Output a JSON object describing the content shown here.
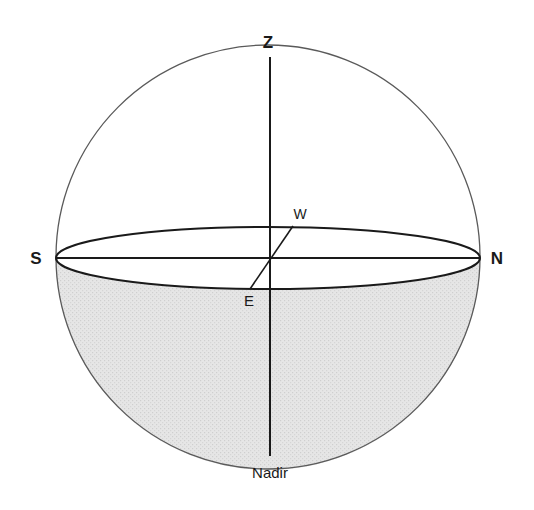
{
  "diagram": {
    "type": "celestial-sphere",
    "labels": {
      "zenith": "Z",
      "nadir": "Nadir",
      "south": "S",
      "north": "N",
      "west": "W",
      "east": "E"
    },
    "colors": {
      "stroke": "#1a1a1a",
      "lower_hemisphere_fill": "#e4e4e4",
      "background": "#ffffff"
    },
    "geometry": {
      "center": [
        268,
        257
      ],
      "radius": 212,
      "horizon_semi_minor": 31
    }
  }
}
